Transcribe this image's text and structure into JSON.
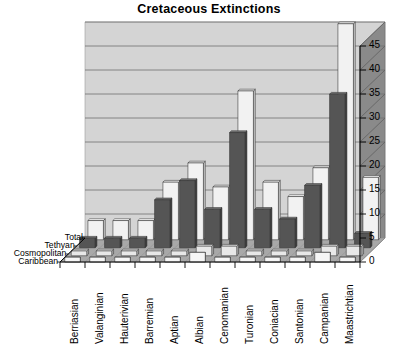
{
  "title": "Cretaceous Extinctions",
  "colors": {
    "wall_back": "#d4d4d4",
    "wall_side": "#8a8a8a",
    "floor": "#a8a8a8",
    "gridline": "#6e6e6e",
    "total_front": "#f2f2f2",
    "total_side": "#c9c9c9",
    "total_top": "#ffffff",
    "tethyan_front": "#555555",
    "tethyan_side": "#3d3d3d",
    "tethyan_top": "#777777",
    "cosmopolitan_front": "#e8e8e8",
    "caribbean_front": "#f5f5f5",
    "axis": "#000000",
    "text": "#000000"
  },
  "yaxis": {
    "ticks": [
      "0",
      "5",
      "10",
      "15",
      "20",
      "25",
      "30",
      "35",
      "40",
      "45"
    ],
    "min": 0,
    "max": 45,
    "step": 5
  },
  "series_labels": [
    "Total",
    "Tethyan",
    "Cosmopolitan",
    "Caribbean"
  ],
  "categories": [
    "Berriasian",
    "Valanginian",
    "Hauterivian",
    "Barremian",
    "Aptian",
    "Albian",
    "Cenomanian",
    "Turonian",
    "Coniacian",
    "Santonian",
    "Campanian",
    "Maastrichtian"
  ],
  "chart_data": {
    "type": "bar",
    "title": "Cretaceous Extinctions",
    "xlabel": "",
    "ylabel": "",
    "ylim": [
      0,
      45
    ],
    "ytick_step": 5,
    "grid": true,
    "legend": "z-axis series labels at left",
    "projection": "3d",
    "categories": [
      "Berriasian",
      "Valanginian",
      "Hauterivian",
      "Barremian",
      "Aptian",
      "Albian",
      "Cenomanian",
      "Turonian",
      "Coniacian",
      "Santonian",
      "Campanian",
      "Maastrichtian"
    ],
    "series": [
      {
        "name": "Total",
        "values": [
          4,
          4,
          4,
          12,
          16,
          11,
          31,
          12,
          9,
          15,
          45,
          13
        ]
      },
      {
        "name": "Tethyan",
        "values": [
          2,
          2,
          2,
          10,
          14,
          8,
          24,
          8,
          6,
          13,
          32,
          3
        ]
      },
      {
        "name": "Cosmopolitan",
        "values": [
          1,
          1,
          1,
          1,
          1,
          2,
          2,
          1,
          1,
          1,
          2,
          2
        ]
      },
      {
        "name": "Caribbean",
        "values": [
          1,
          1,
          1,
          1,
          1,
          2,
          1,
          1,
          1,
          1,
          2,
          1
        ]
      }
    ]
  }
}
